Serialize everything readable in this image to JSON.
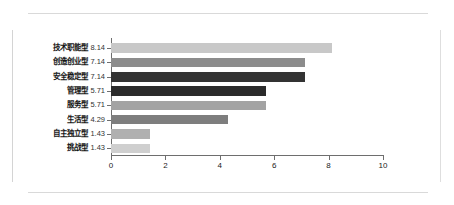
{
  "chart_data": {
    "type": "bar",
    "orientation": "horizontal",
    "title": "",
    "xlabel": "",
    "ylabel": "",
    "xlim": [
      0,
      10
    ],
    "grid": false,
    "legend": null,
    "xticks": [
      "0",
      "2",
      "4",
      "6",
      "8",
      "10"
    ],
    "categories": [
      "技术职能型",
      "创造创业型",
      "安全稳定型",
      "管理型",
      "服务型",
      "生活型",
      "自主独立型",
      "挑战型"
    ],
    "values": [
      8.14,
      7.14,
      7.14,
      5.71,
      5.71,
      4.29,
      1.43,
      1.43
    ],
    "value_labels": [
      "8.14",
      "7.14",
      "7.14",
      "5.71",
      "5.71",
      "4.29",
      "1.43",
      "1.43"
    ],
    "bar_colors": [
      "#c8c8c8",
      "#8c8c8c",
      "#333333",
      "#2b2b2b",
      "#a3a3a3",
      "#7e7e7e",
      "#b0b0b0",
      "#cfcfcf"
    ],
    "axis_color": "#6e6e6e",
    "background": "#ffffff"
  }
}
